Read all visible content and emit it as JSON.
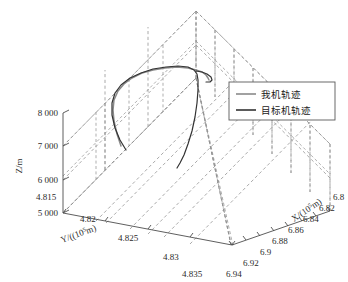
{
  "figure": {
    "kind": "3d-line-plot",
    "background": "#ffffff",
    "grid_color": "#8c8c8c",
    "axis_color": "#4d4d4d",
    "text_color": "#2b2b2b"
  },
  "axes": {
    "x": {
      "label_main": "X/(10",
      "label_exp": "5",
      "label_tail": "m)",
      "label_full": "X/(10⁵m)",
      "ticks": [
        "6.8",
        "6.82",
        "6.84",
        "6.86",
        "6.88",
        "6.9",
        "6.92",
        "6.94"
      ],
      "min": 6.8,
      "max": 6.94
    },
    "y": {
      "label_main": "Y/((10",
      "label_exp": "5",
      "label_tail": "m)",
      "label_full": "Y/((10⁵m)",
      "ticks": [
        "4.815",
        "4.82",
        "4.825",
        "4.83",
        "4.835"
      ],
      "min": 4.815,
      "max": 4.835
    },
    "z": {
      "label_full": "Z/m",
      "ticks": [
        "5 000",
        "6 000",
        "7 000",
        "8 000"
      ],
      "min": 5000,
      "max": 8000
    }
  },
  "legend": {
    "position": "upper-right",
    "border_color": "#5a5a5a",
    "background": "#ffffff",
    "entries": [
      {
        "label": "我机轨迹",
        "color": "#8a8a8a",
        "width": 1.4
      },
      {
        "label": "目标机轨迹",
        "color": "#333333",
        "width": 1.4
      }
    ]
  },
  "chart_data": {
    "type": "line",
    "title": "",
    "xlabel": "X/(10⁵m)",
    "ylabel": "Y/((10⁵m)",
    "zlabel": "Z/m",
    "xlim": [
      6.8,
      6.94
    ],
    "ylim": [
      4.815,
      4.835
    ],
    "zlim": [
      5000,
      8000
    ],
    "grid": true,
    "projection": "3d",
    "legend_position": "upper right",
    "series": [
      {
        "name": "我机轨迹",
        "color": "#8a8a8a",
        "screen_path": "M 121,146 L 117,134 L 114,121 L 113,110 L 114,100 L 118,91 L 124,84 L 132,78 L 142,73 L 153,70 L 165,68 L 177,67 L 188,68 L 196,70 L 202,72 L 206,75 L 208,78 L 209,80",
        "points_xyz": [
          [
            6.842,
            4.8212,
            5980
          ],
          [
            6.84,
            4.8209,
            6290
          ],
          [
            6.838,
            4.8206,
            6620
          ],
          [
            6.837,
            4.8204,
            6910
          ],
          [
            6.838,
            4.8203,
            7180
          ],
          [
            6.841,
            4.8205,
            7420
          ],
          [
            6.846,
            4.821,
            7610
          ],
          [
            6.853,
            4.8217,
            7760
          ],
          [
            6.862,
            4.8226,
            7880
          ],
          [
            6.872,
            4.8236,
            7950
          ],
          [
            6.883,
            4.8247,
            8000
          ],
          [
            6.894,
            4.8258,
            8020
          ],
          [
            6.904,
            4.8268,
            8000
          ],
          [
            6.912,
            4.8276,
            7950
          ],
          [
            6.918,
            4.8282,
            7890
          ],
          [
            6.922,
            4.8286,
            7820
          ],
          [
            6.925,
            4.8289,
            7760
          ],
          [
            6.926,
            4.829,
            7710
          ]
        ]
      },
      {
        "name": "目标机轨迹",
        "color": "#333333",
        "screen_path": "M 126,150 L 120,140 L 115,128 L 112,115 L 112,103 L 115,93 L 121,85 L 130,78 L 141,73 L 153,69 L 166,67 L 178,66 L 188,67 L 194,70 L 197,74 L 198,80 L 198,90 L 197,103 L 195,117 L 192,131 L 188,144 L 184,155 L 180,163 L 177,168",
        "points_xyz": [
          [
            6.846,
            4.8216,
            5900
          ],
          [
            6.843,
            4.8212,
            6170
          ],
          [
            6.84,
            4.8208,
            6480
          ],
          [
            6.838,
            4.8205,
            6820
          ],
          [
            6.838,
            4.8203,
            7130
          ],
          [
            6.841,
            4.8204,
            7390
          ],
          [
            6.846,
            4.8209,
            7600
          ],
          [
            6.854,
            4.8217,
            7770
          ],
          [
            6.864,
            4.8227,
            7890
          ],
          [
            6.875,
            4.8239,
            7970
          ],
          [
            6.887,
            4.8251,
            8010
          ],
          [
            6.897,
            4.8262,
            8030
          ],
          [
            6.906,
            4.8271,
            8010
          ],
          [
            6.911,
            4.8277,
            7950
          ],
          [
            6.913,
            4.828,
            7850
          ],
          [
            6.913,
            4.8281,
            7700
          ],
          [
            6.912,
            4.8281,
            7450
          ],
          [
            6.91,
            4.828,
            7130
          ],
          [
            6.907,
            4.8278,
            6790
          ],
          [
            6.903,
            4.8275,
            6450
          ],
          [
            6.899,
            4.8271,
            6140
          ],
          [
            6.895,
            4.8267,
            5890
          ],
          [
            6.892,
            4.8264,
            5700
          ],
          [
            6.89,
            4.8262,
            5590
          ]
        ]
      },
      {
        "name": "目标机轨迹-tail",
        "color": "#333333",
        "screen_path": "M 196,71 L 202,72 L 207,74 L 211,77 L 212,80 L 210,82 L 206,82",
        "points_xyz": []
      }
    ]
  }
}
